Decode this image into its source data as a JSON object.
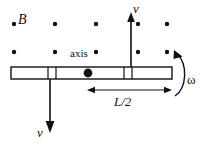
{
  "figure": {
    "labels": {
      "field": "B",
      "axis": "axis",
      "velocity_top": "v",
      "velocity_bottom": "v",
      "half_length": "L/2",
      "angular_velocity": "ω"
    },
    "colors": {
      "ink": "#111111",
      "rod_fill": "#ffffff",
      "background": "#ffffff"
    },
    "field_dots": {
      "name": "magnetic-field-out-of-page",
      "rows": [
        {
          "y": 24,
          "xs": [
            14,
            55,
            96,
            138,
            167
          ]
        },
        {
          "y": 52,
          "xs": [
            14,
            55,
            96,
            138,
            167
          ]
        }
      ],
      "radius": 2.2
    },
    "rod": {
      "x": 11,
      "y": 67,
      "width": 161,
      "height": 12,
      "tick_xs": [
        48,
        56,
        124,
        132
      ]
    },
    "pivot": {
      "cx": 88,
      "cy": 73,
      "r": 4.4
    },
    "arrow_up": {
      "x": 131,
      "y_tail": 73,
      "y_head": 14
    },
    "arrow_down": {
      "x": 50,
      "y_tail": 73,
      "y_head": 132
    },
    "dim_arrow": {
      "y": 90,
      "x1": 88,
      "x2": 171
    },
    "omega_arc": {
      "cx": 172,
      "cy": 75,
      "r": 22
    }
  }
}
